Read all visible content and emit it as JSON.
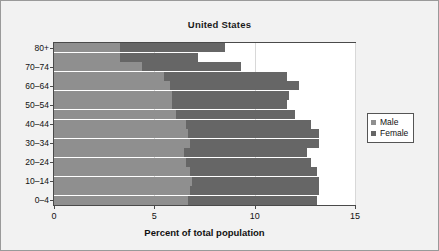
{
  "chart_data": {
    "type": "bar",
    "orientation": "horizontal",
    "stacked": true,
    "title": "United States",
    "xlabel": "Percent of total population",
    "ylabel": "",
    "xlim": [
      0,
      15
    ],
    "xticks": [
      0,
      5,
      10,
      15
    ],
    "xticklabels": [
      "0",
      "5",
      "10",
      "15"
    ],
    "grid": true,
    "legend_position": "right",
    "categories": [
      "0–4",
      "5–9",
      "10–14",
      "15–19",
      "20–24",
      "25–29",
      "30–34",
      "35–39",
      "40–44",
      "45–49",
      "50–54",
      "55–59",
      "60–64",
      "65–69",
      "70–74",
      "75–79",
      "80+"
    ],
    "visible_ytick_labels": [
      "0–4",
      "10–14",
      "20–24",
      "30–34",
      "40–44",
      "50–54",
      "60–64",
      "70–74",
      "80+"
    ],
    "series": [
      {
        "name": "Male",
        "color": "#8f8f8f",
        "values": [
          6.7,
          6.8,
          6.9,
          6.8,
          6.6,
          6.5,
          6.8,
          6.7,
          6.6,
          6.1,
          5.9,
          5.9,
          5.8,
          5.5,
          4.4,
          3.3,
          3.3
        ]
      },
      {
        "name": "Female",
        "color": "#666666",
        "values": [
          6.4,
          6.4,
          6.3,
          6.3,
          6.2,
          6.1,
          6.4,
          6.5,
          6.2,
          5.9,
          5.7,
          5.8,
          6.4,
          6.1,
          4.9,
          3.9,
          5.2
        ]
      }
    ],
    "totals": [
      13.1,
      13.2,
      13.2,
      13.1,
      12.8,
      12.6,
      13.2,
      13.2,
      12.8,
      12.0,
      11.6,
      11.7,
      12.2,
      11.6,
      9.3,
      7.2,
      8.5
    ]
  },
  "legend": {
    "items": [
      {
        "label": "Male",
        "color": "#8f8f8f"
      },
      {
        "label": "Female",
        "color": "#666666"
      }
    ]
  }
}
